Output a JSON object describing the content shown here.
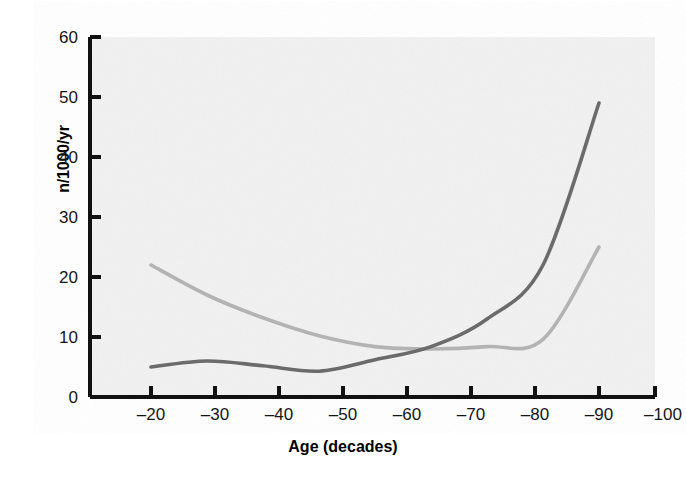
{
  "chart_data": {
    "type": "line",
    "title": "",
    "xlabel": "Age (decades)",
    "ylabel": "n/1000/yr",
    "categories": [
      "–20",
      "–30",
      "–40",
      "–50",
      "–60",
      "–70",
      "–80",
      "–90",
      "–100"
    ],
    "x": [
      -20,
      -30,
      -40,
      -50,
      -60,
      -70,
      -80,
      -90,
      -100
    ],
    "xlim": [
      -20,
      -100
    ],
    "ylim": [
      0,
      60
    ],
    "yticks": [
      0,
      10,
      20,
      30,
      40,
      50,
      60
    ],
    "ytick_labels": [
      "0",
      "10",
      "20",
      "30",
      "40",
      "50",
      "60"
    ],
    "grid": false,
    "legend_position": "right-of-line-ends",
    "series": [
      {
        "name": "♀",
        "label": "female",
        "color": "#6b6b6b",
        "values": [
          5.0,
          6.0,
          5.2,
          4.3,
          6.2,
          8.4,
          13.0,
          22.0,
          49.0
        ]
      },
      {
        "name": "♂",
        "label": "male",
        "color": "#b3b3b3",
        "values": [
          22.0,
          17.0,
          13.2,
          10.2,
          8.4,
          8.0,
          8.4,
          9.6,
          25.0
        ]
      }
    ],
    "annotations": [
      {
        "text": "♀",
        "series": "female",
        "x": -100,
        "y": 46.5
      },
      {
        "text": "♂",
        "series": "male",
        "x": -100,
        "y": 27.5
      }
    ]
  },
  "colors": {
    "plot_background": "#f2f2f2",
    "axis": "#111111",
    "female_line": "#6b6b6b",
    "male_line": "#b3b3b3",
    "text": "#111111"
  }
}
